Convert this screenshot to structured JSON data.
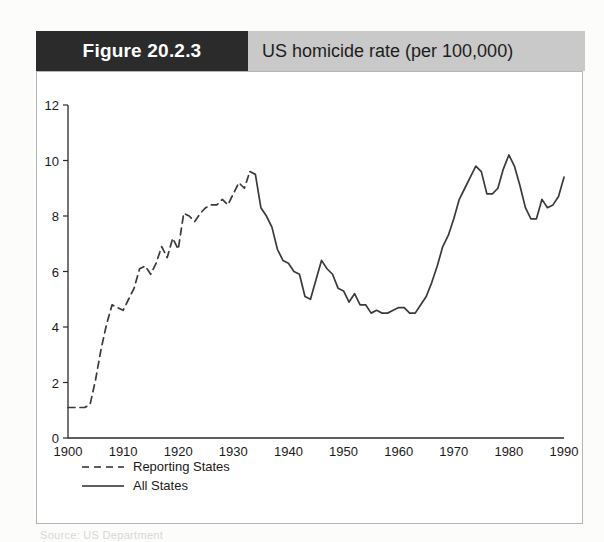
{
  "figure": {
    "number_label": "Figure 20.2.3",
    "title": "US homicide rate (per 100,000)",
    "caption_partial": "Source: US Department"
  },
  "chart_data": {
    "type": "line",
    "title": "US homicide rate (per 100,000)",
    "xlabel": "",
    "ylabel": "",
    "xlim": [
      1900,
      1990
    ],
    "ylim": [
      0,
      12
    ],
    "xticks": [
      1900,
      1910,
      1920,
      1930,
      1940,
      1950,
      1960,
      1970,
      1980,
      1990
    ],
    "yticks": [
      0,
      2,
      4,
      6,
      8,
      10,
      12
    ],
    "grid": false,
    "legend_position": "below-axes-left",
    "series": [
      {
        "name": "Reporting States",
        "style": "dashed",
        "color": "#3a3a3a",
        "x": [
          1900,
          1901,
          1902,
          1903,
          1904,
          1905,
          1906,
          1907,
          1908,
          1909,
          1910,
          1911,
          1912,
          1913,
          1914,
          1915,
          1916,
          1917,
          1918,
          1919,
          1920,
          1921,
          1922,
          1923,
          1924,
          1925,
          1926,
          1927,
          1928,
          1929,
          1930,
          1931,
          1932,
          1933
        ],
        "values": [
          1.1,
          1.1,
          1.1,
          1.1,
          1.2,
          2.1,
          3.2,
          4.1,
          4.8,
          4.7,
          4.6,
          5.0,
          5.4,
          6.1,
          6.2,
          5.9,
          6.3,
          6.9,
          6.5,
          7.2,
          6.8,
          8.1,
          8.0,
          7.8,
          8.1,
          8.3,
          8.4,
          8.4,
          8.6,
          8.4,
          8.8,
          9.2,
          9.0,
          9.6
        ]
      },
      {
        "name": "All States",
        "style": "solid",
        "color": "#3a3a3a",
        "x": [
          1933,
          1934,
          1935,
          1936,
          1937,
          1938,
          1939,
          1940,
          1941,
          1942,
          1943,
          1944,
          1945,
          1946,
          1947,
          1948,
          1949,
          1950,
          1951,
          1952,
          1953,
          1954,
          1955,
          1956,
          1957,
          1958,
          1959,
          1960,
          1961,
          1962,
          1963,
          1964,
          1965,
          1966,
          1967,
          1968,
          1969,
          1970,
          1971,
          1972,
          1973,
          1974,
          1975,
          1976,
          1977,
          1978,
          1979,
          1980,
          1981,
          1982,
          1983,
          1984,
          1985,
          1986,
          1987,
          1988,
          1989,
          1990
        ],
        "values": [
          9.6,
          9.5,
          8.3,
          8.0,
          7.6,
          6.8,
          6.4,
          6.3,
          6.0,
          5.9,
          5.1,
          5.0,
          5.7,
          6.4,
          6.1,
          5.9,
          5.4,
          5.3,
          4.9,
          5.2,
          4.8,
          4.8,
          4.5,
          4.6,
          4.5,
          4.5,
          4.6,
          4.7,
          4.7,
          4.5,
          4.5,
          4.8,
          5.1,
          5.6,
          6.2,
          6.9,
          7.3,
          7.9,
          8.6,
          9.0,
          9.4,
          9.8,
          9.6,
          8.8,
          8.8,
          9.0,
          9.7,
          10.2,
          9.8,
          9.1,
          8.3,
          7.9,
          7.9,
          8.6,
          8.3,
          8.4,
          8.7,
          9.4
        ]
      }
    ]
  },
  "legend": {
    "items": [
      {
        "label": "Reporting States",
        "style": "dashed"
      },
      {
        "label": "All States",
        "style": "solid"
      }
    ]
  }
}
